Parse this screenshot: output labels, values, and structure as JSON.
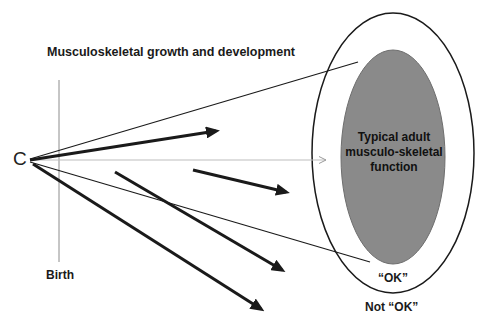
{
  "diagram": {
    "title": "Musculoskeletal growth and development",
    "origin_label": "C",
    "birth_label": "Birth",
    "center_label": "Typical adult musculo-skeletal function",
    "inner_zone_label": "“OK”",
    "outer_zone_label": "Not “OK”",
    "colors": {
      "background": "#ffffff",
      "inner_ellipse_fill": "#8a8a8a",
      "line": "#1a1a1a",
      "guide_line": "#bdbdbd"
    },
    "shapes": {
      "outer_ellipse": {
        "cx": 393,
        "cy": 153,
        "rx": 81,
        "ry": 140
      },
      "inner_ellipse": {
        "cx": 393,
        "cy": 157,
        "rx": 52,
        "ry": 107
      },
      "birth_line": {
        "x": 59,
        "y1": 80,
        "y2": 262
      },
      "guide_arrow": {
        "x1": 30,
        "y1": 160,
        "x2": 326,
        "y2": 160
      },
      "boundary_lines": [
        {
          "x1": 30,
          "y1": 159,
          "x2": 358,
          "y2": 62
        },
        {
          "x1": 30,
          "y1": 162,
          "x2": 370,
          "y2": 262
        }
      ],
      "trajectory_arrows": [
        {
          "x1": 30,
          "y1": 160,
          "x2": 221,
          "y2": 130
        },
        {
          "x1": 193,
          "y1": 170,
          "x2": 291,
          "y2": 193
        },
        {
          "x1": 115,
          "y1": 172,
          "x2": 286,
          "y2": 273
        },
        {
          "x1": 33,
          "y1": 164,
          "x2": 265,
          "y2": 312
        }
      ]
    }
  }
}
